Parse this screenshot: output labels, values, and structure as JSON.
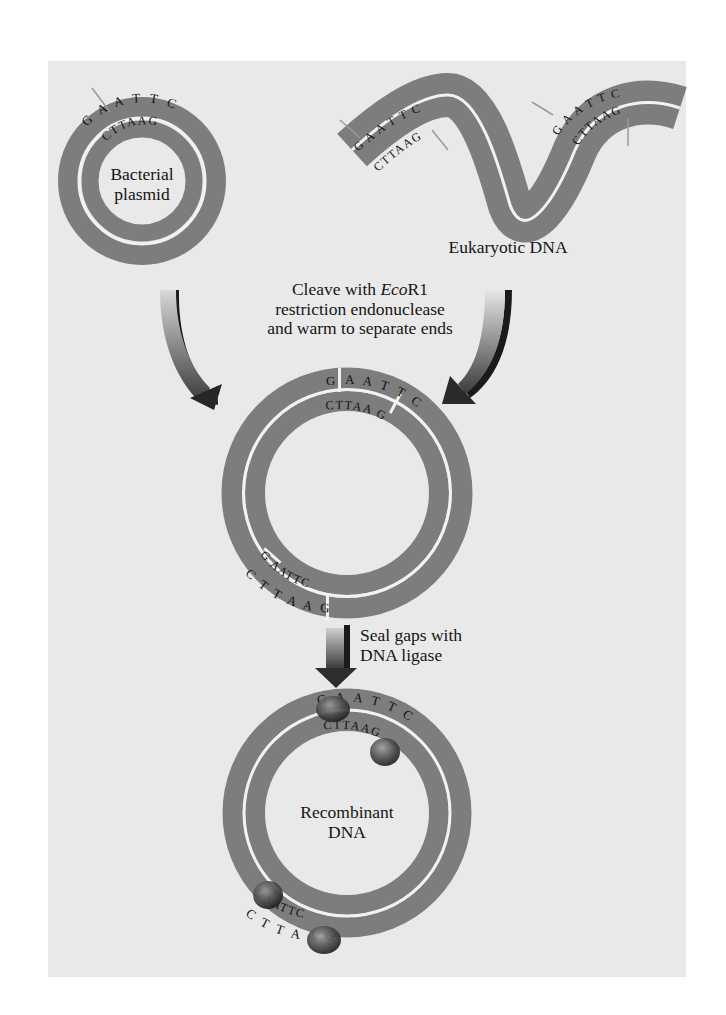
{
  "figure": {
    "colors": {
      "background": "#e9e9e9",
      "strand": "#7d7d7d",
      "strand_gap": "#f2f2f2",
      "text": "#151515",
      "pointer": "#9a9a9a"
    }
  },
  "step1": {
    "plasmid": {
      "label_line1": "Bacterial",
      "label_line2": "plasmid",
      "outer_sequence": "GAATTC",
      "inner_sequence": "CTTAAG"
    },
    "eukaryotic": {
      "label": "Eukaryotic DNA",
      "site_left_outer": "GAATTC",
      "site_left_inner": "CTTAAG",
      "site_right_outer": "GAATTC",
      "site_right_inner": "CTTAAG"
    }
  },
  "step2": {
    "instruction_line1_prefix": "Cleave with ",
    "instruction_enzyme_italic": "Eco",
    "instruction_enzyme_suffix": "R1",
    "instruction_line2": "restriction endonuclease",
    "instruction_line3": "and warm to separate ends",
    "ring": {
      "top_outer_left": "G",
      "top_outer_right": "AATTC",
      "top_inner_left": "CTTAA",
      "top_inner_right": "G",
      "bottom_inner_left": "G",
      "bottom_inner_right": "AATTC",
      "bottom_outer_left": "CTTAA",
      "bottom_outer_right": "G"
    }
  },
  "step3": {
    "instruction_line1": "Seal gaps with",
    "instruction_line2": "DNA ligase",
    "ring": {
      "label_line1": "Recombinant",
      "label_line2": "DNA",
      "top_outer": "GAATTC",
      "top_inner": "CTTAAG",
      "bottom_inner": "GAATTC",
      "bottom_outer": "CTTAAG",
      "ligase_sites": 4
    }
  }
}
